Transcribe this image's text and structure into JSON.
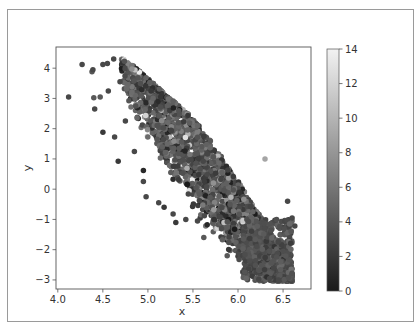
{
  "chart_data": {
    "type": "scatter",
    "title": "",
    "xlabel": "x",
    "ylabel": "y",
    "xlim": [
      3.98,
      6.81
    ],
    "ylim": [
      -3.3,
      4.7
    ],
    "xticks": [
      4.0,
      4.5,
      5.0,
      5.5,
      6.0,
      6.5
    ],
    "xtick_labels": [
      "4.0",
      "4.5",
      "5.0",
      "5.5",
      "6.0",
      "6.5"
    ],
    "yticks": [
      -3,
      -2,
      -1,
      0,
      1,
      2,
      3,
      4
    ],
    "ytick_labels": [
      "−3",
      "−2",
      "−1",
      "0",
      "1",
      "2",
      "3",
      "4"
    ],
    "grid": false,
    "colormap": "gray",
    "colorbar": {
      "range": [
        0,
        14
      ],
      "ticks": [
        0,
        2,
        4,
        6,
        8,
        10,
        12,
        14
      ],
      "tick_labels": [
        "0",
        "2",
        "4",
        "6",
        "8",
        "10",
        "12",
        "14"
      ],
      "low_color": "#1a1a1a",
      "high_color": "#f2f2f2"
    },
    "marker_size_px": 5.5,
    "point_cloud": {
      "description": "Dense diagonal band of ~2500 points running from upper-left (x~4.6, y~4.2) to lower-right (x~6.5, y~-3.0); color values mostly 2-6 with sparse bright points up to ~14",
      "count": 2600,
      "x_range": [
        4.7,
        6.6
      ],
      "center_line": {
        "x0": 4.8,
        "y0": 3.9,
        "x1": 6.45,
        "y1": -2.6
      },
      "band_halfwidth": 1.0,
      "color_mean": 4.0,
      "color_sd": 1.6,
      "bright_fraction": 0.05
    },
    "sample_points": [
      {
        "x": 4.12,
        "y": 3.05,
        "c": 3
      },
      {
        "x": 4.27,
        "y": 4.12,
        "c": 3
      },
      {
        "x": 4.38,
        "y": 3.88,
        "c": 4
      },
      {
        "x": 4.39,
        "y": 3.95,
        "c": 3
      },
      {
        "x": 4.4,
        "y": 3.02,
        "c": 4
      },
      {
        "x": 4.41,
        "y": 2.65,
        "c": 3
      },
      {
        "x": 4.47,
        "y": 3.05,
        "c": 4
      },
      {
        "x": 4.5,
        "y": 1.88,
        "c": 2
      },
      {
        "x": 4.5,
        "y": 4.12,
        "c": 3
      },
      {
        "x": 4.55,
        "y": 4.15,
        "c": 3
      },
      {
        "x": 4.56,
        "y": 3.25,
        "c": 3
      },
      {
        "x": 4.63,
        "y": 1.72,
        "c": 3
      },
      {
        "x": 4.67,
        "y": 0.92,
        "c": 2
      },
      {
        "x": 4.62,
        "y": 4.3,
        "c": 3
      },
      {
        "x": 4.69,
        "y": 3.55,
        "c": 3
      },
      {
        "x": 4.75,
        "y": 2.25,
        "c": 3
      },
      {
        "x": 4.85,
        "y": 1.25,
        "c": 3
      },
      {
        "x": 4.95,
        "y": 0.25,
        "c": 3
      },
      {
        "x": 4.98,
        "y": -0.25,
        "c": 3
      },
      {
        "x": 4.95,
        "y": 0.62,
        "c": 1
      },
      {
        "x": 5.12,
        "y": -0.45,
        "c": 3
      },
      {
        "x": 5.18,
        "y": -0.6,
        "c": 2
      },
      {
        "x": 5.28,
        "y": -0.82,
        "c": 3
      },
      {
        "x": 5.31,
        "y": -1.1,
        "c": 2
      },
      {
        "x": 5.42,
        "y": -1.0,
        "c": 3
      },
      {
        "x": 5.55,
        "y": -1.05,
        "c": 3
      },
      {
        "x": 5.62,
        "y": -1.6,
        "c": 4
      },
      {
        "x": 5.88,
        "y": -2.2,
        "c": 4
      },
      {
        "x": 6.3,
        "y": 1.0,
        "c": 9
      },
      {
        "x": 6.55,
        "y": -0.4,
        "c": 3
      },
      {
        "x": 6.6,
        "y": -0.95,
        "c": 3
      },
      {
        "x": 6.63,
        "y": -1.22,
        "c": 3
      },
      {
        "x": 6.45,
        "y": -3.0,
        "c": 3
      },
      {
        "x": 6.35,
        "y": -2.95,
        "c": 3
      }
    ]
  }
}
